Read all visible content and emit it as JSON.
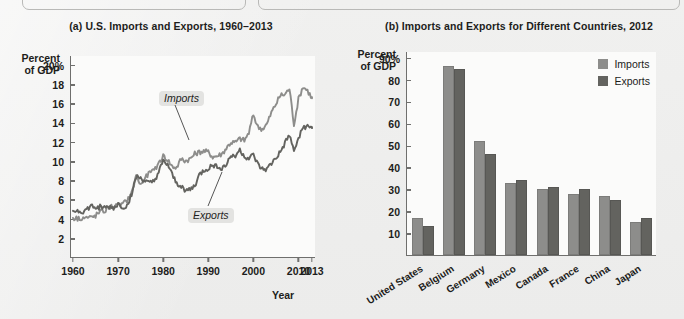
{
  "background_color": "#ececeb",
  "panel_a": {
    "title": "(a) U.S. Imports and Exports, 1960–2013",
    "y_axis_title_line1": "Percent",
    "y_axis_title_line2": "of GDP",
    "x_axis_title": "Year",
    "series_label_imports": "Imports",
    "series_label_exports": "Exports"
  },
  "panel_b": {
    "title": "(b) Imports and Exports for Different Countries, 2012",
    "y_axis_title_line1": "Percent",
    "y_axis_title_line2": "of GDP",
    "legend_imports": "Imports",
    "legend_exports": "Exports"
  },
  "colors": {
    "imports": "#8d8d8b",
    "exports": "#63635f",
    "axis": "#6f6f6d",
    "plot_bg": "#fbfbfa"
  },
  "chart_data": [
    {
      "type": "line",
      "title": "(a) U.S. Imports and Exports, 1960–2013",
      "xlabel": "Year",
      "ylabel": "Percent of GDP",
      "xlim": [
        1960,
        2013
      ],
      "ylim": [
        0,
        21
      ],
      "ytick_labels": [
        "20%",
        "18",
        "16",
        "14",
        "12",
        "10",
        "8",
        "6",
        "4",
        "2"
      ],
      "ytick_values": [
        20,
        18,
        16,
        14,
        12,
        10,
        8,
        6,
        4,
        2
      ],
      "xtick_labels": [
        "1960",
        "1970",
        "1980",
        "1990",
        "2000",
        "2010",
        "2013"
      ],
      "xtick_values": [
        1960,
        1970,
        1980,
        1990,
        2000,
        2010,
        2013
      ],
      "grid": false,
      "legend_position": "inline-annotation",
      "series": [
        {
          "name": "Imports",
          "color": "#8d8d8b",
          "x": [
            1960,
            1961,
            1962,
            1963,
            1964,
            1965,
            1966,
            1967,
            1968,
            1969,
            1970,
            1971,
            1972,
            1973,
            1974,
            1975,
            1976,
            1977,
            1978,
            1979,
            1980,
            1981,
            1982,
            1983,
            1984,
            1985,
            1986,
            1987,
            1988,
            1989,
            1990,
            1991,
            1992,
            1993,
            1994,
            1995,
            1996,
            1997,
            1998,
            1999,
            2000,
            2001,
            2002,
            2003,
            2004,
            2005,
            2006,
            2007,
            2008,
            2009,
            2010,
            2011,
            2012,
            2013
          ],
          "values": [
            4.2,
            4.1,
            4.2,
            4.2,
            4.2,
            4.4,
            4.8,
            4.9,
            5.3,
            5.4,
            5.4,
            5.6,
            6.0,
            6.7,
            8.6,
            7.6,
            8.3,
            8.9,
            9.0,
            9.9,
            10.6,
            10.2,
            9.5,
            9.4,
            10.3,
            10.1,
            10.3,
            10.8,
            11.0,
            11.1,
            11.0,
            10.5,
            10.6,
            10.8,
            11.4,
            12.0,
            12.0,
            12.4,
            12.2,
            13.0,
            14.9,
            13.6,
            13.4,
            13.9,
            15.1,
            16.0,
            16.9,
            17.0,
            17.6,
            13.9,
            16.5,
            17.8,
            17.4,
            16.6
          ]
        },
        {
          "name": "Exports",
          "color": "#63635f",
          "x": [
            1960,
            1961,
            1962,
            1963,
            1964,
            1965,
            1966,
            1967,
            1968,
            1969,
            1970,
            1971,
            1972,
            1973,
            1974,
            1975,
            1976,
            1977,
            1978,
            1979,
            1980,
            1981,
            1982,
            1983,
            1984,
            1985,
            1986,
            1987,
            1988,
            1989,
            1990,
            1991,
            1992,
            1993,
            1994,
            1995,
            1996,
            1997,
            1998,
            1999,
            2000,
            2001,
            2002,
            2003,
            2004,
            2005,
            2006,
            2007,
            2008,
            2009,
            2010,
            2011,
            2012,
            2013
          ],
          "values": [
            4.9,
            4.9,
            4.8,
            5.0,
            5.4,
            5.2,
            5.3,
            5.2,
            5.3,
            5.2,
            5.6,
            5.3,
            5.4,
            6.7,
            8.4,
            8.3,
            8.0,
            7.7,
            8.0,
            8.9,
            10.0,
            9.7,
            8.6,
            7.7,
            7.5,
            7.0,
            7.1,
            7.5,
            8.6,
            9.1,
            9.3,
            9.6,
            9.6,
            9.3,
            9.7,
            10.6,
            10.7,
            11.2,
            10.6,
            10.3,
            10.7,
            9.7,
            9.2,
            9.2,
            9.8,
            10.4,
            11.0,
            11.9,
            12.8,
            11.0,
            12.5,
            13.6,
            13.6,
            13.5
          ]
        }
      ]
    },
    {
      "type": "bar",
      "title": "(b) Imports and Exports for Different Countries, 2012",
      "xlabel": "",
      "ylabel": "Percent of GDP",
      "ylim": [
        0,
        93
      ],
      "ytick_labels": [
        "90%",
        "80",
        "70",
        "60",
        "50",
        "40",
        "30",
        "20",
        "10"
      ],
      "ytick_values": [
        90,
        80,
        70,
        60,
        50,
        40,
        30,
        20,
        10
      ],
      "grid": false,
      "legend_position": "top-right",
      "categories": [
        "United States",
        "Belgium",
        "Germany",
        "Mexico",
        "Canada",
        "France",
        "China",
        "Japan"
      ],
      "series": [
        {
          "name": "Imports",
          "color": "#8d8d8b",
          "values": [
            17,
            86,
            52,
            33,
            30,
            28,
            27,
            15
          ]
        },
        {
          "name": "Exports",
          "color": "#63635f",
          "values": [
            13,
            85,
            46,
            34,
            31,
            30,
            25,
            17
          ]
        }
      ]
    }
  ]
}
